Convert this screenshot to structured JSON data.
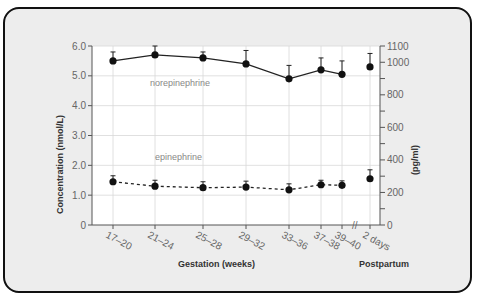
{
  "chart_data": {
    "type": "line",
    "title": "",
    "xlabel": "Gestation (weeks)",
    "xlabel_secondary": "Postpartum",
    "ylabel": "Concentration (nmol/L)",
    "ylabel_right": "(pg/ml)",
    "categories": [
      "17–20",
      "21–24",
      "25–28",
      "29–32",
      "33–36",
      "37–38",
      "39–40",
      "2 days"
    ],
    "ylim": [
      0,
      6.0
    ],
    "ylim_right": [
      0,
      1100
    ],
    "yticks": [
      "0",
      "1.0",
      "2.0",
      "3.0",
      "4.0",
      "5.0",
      "6.0"
    ],
    "yticks_right": [
      "0",
      "200",
      "400",
      "600",
      "800",
      "1000",
      "1100"
    ],
    "grid": true,
    "axis_break": "between 39–40 and 2 days",
    "series": [
      {
        "name": "norepinephrine",
        "style": "solid",
        "values": [
          5.5,
          5.7,
          5.6,
          5.4,
          4.9,
          5.2,
          5.05,
          5.3
        ],
        "error_upper": [
          0.3,
          0.3,
          0.2,
          0.45,
          0.45,
          0.4,
          0.45,
          0.45
        ]
      },
      {
        "name": "epinephrine",
        "style": "dashed",
        "values": [
          1.45,
          1.3,
          1.25,
          1.27,
          1.18,
          1.35,
          1.33,
          1.55
        ],
        "error_upper": [
          0.2,
          0.2,
          0.2,
          0.2,
          0.2,
          0.15,
          0.15,
          0.3
        ]
      }
    ]
  },
  "labels": {
    "norepinephrine": "norepinephrine",
    "epinephrine": "epinephrine",
    "xlabel": "Gestation (weeks)",
    "postpartum": "Postpartum",
    "ylabel": "Concentration (nmol/L)",
    "ylabel_right": "(pg/ml)",
    "break_mark": "//"
  }
}
